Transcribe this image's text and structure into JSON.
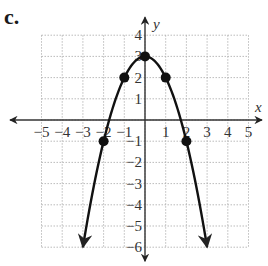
{
  "figure": {
    "label": "c."
  },
  "chart_data": {
    "type": "line",
    "title": "",
    "xlabel": "x",
    "ylabel": "y",
    "xlim": [
      -5,
      5
    ],
    "ylim": [
      -6,
      4
    ],
    "grid": true,
    "x_ticks": [
      -5,
      -4,
      -3,
      -2,
      -1,
      1,
      2,
      3,
      4,
      5
    ],
    "y_ticks": [
      4,
      3,
      2,
      1,
      -1,
      -2,
      -3,
      -4,
      -5,
      -6
    ],
    "function": "y = 3 - x^2",
    "series": [
      {
        "name": "parabola",
        "points": [
          [
            -2,
            -1
          ],
          [
            -1,
            2
          ],
          [
            0,
            3
          ],
          [
            1,
            2
          ],
          [
            2,
            -1
          ]
        ],
        "x": [
          -2,
          -1,
          0,
          1,
          2
        ],
        "values": [
          -1,
          2,
          3,
          2,
          -1
        ]
      }
    ],
    "curve_extends_with_arrows": true,
    "arrow_ends": [
      [
        -3,
        -6
      ],
      [
        3,
        -6
      ]
    ]
  }
}
